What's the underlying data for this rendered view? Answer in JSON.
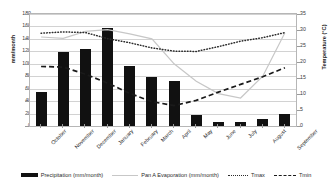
{
  "chart_data": {
    "type": "bar",
    "title": "",
    "subtitle": "",
    "xlabel": "",
    "ylabel": "mm/month",
    "y2label": "Temperature (°C)",
    "ylim": [
      0,
      180
    ],
    "y2lim": [
      0,
      35
    ],
    "ytick_step": 20,
    "y2tick_step": 5,
    "grid": true,
    "legend_position": "bottom",
    "categories": [
      "October",
      "November",
      "December",
      "January",
      "February",
      "March",
      "April",
      "May",
      "June",
      "July",
      "August",
      "September"
    ],
    "ytick_labels": [
      "0",
      "20",
      "40",
      "60",
      "80",
      "100",
      "120",
      "140",
      "160",
      "180"
    ],
    "y2tick_labels": [
      "0",
      "5",
      "10",
      "15",
      "20",
      "25",
      "30",
      "35"
    ],
    "series": [
      {
        "name": "Precipitation (mm/month)",
        "type": "bar",
        "axis": "left",
        "unit": "mm/month",
        "color": "#111111",
        "values": [
          55,
          119,
          124,
          158,
          96,
          79,
          72,
          17,
          6,
          7,
          11,
          20
        ]
      },
      {
        "name": "Pan A Evaporation (mm/month)",
        "type": "line",
        "axis": "left",
        "unit": "mm/month",
        "color": "#c7c7c7",
        "style": "solid",
        "values": [
          143,
          141,
          152,
          155,
          148,
          140,
          100,
          72,
          52,
          45,
          80,
          150
        ]
      },
      {
        "name": "Tmax",
        "type": "line",
        "axis": "right",
        "unit": "°C",
        "color": "#2b2b2b",
        "style": "dotted",
        "values": [
          29.0,
          29.4,
          29.2,
          27.3,
          26.0,
          24.4,
          23.4,
          23.3,
          24.8,
          26.5,
          27.6,
          29.2
        ]
      },
      {
        "name": "Tmin",
        "type": "line",
        "axis": "right",
        "unit": "°C",
        "color": "#1a1a1a",
        "style": "dashed",
        "values": [
          18.6,
          18.4,
          16.2,
          13.4,
          10.2,
          7.6,
          6.4,
          8.0,
          10.6,
          13.0,
          15.4,
          18.2
        ]
      }
    ]
  },
  "legend": {
    "items": [
      {
        "label": "Precipitation (mm/month)",
        "marker": "bar-swatch"
      },
      {
        "label": "Pan A Evaporation (mm/month)",
        "marker": "line-swatch"
      },
      {
        "label": "Tmax",
        "marker": "dotted-line-swatch"
      },
      {
        "label": "Tmin",
        "marker": "dashed-line-swatch"
      }
    ]
  }
}
